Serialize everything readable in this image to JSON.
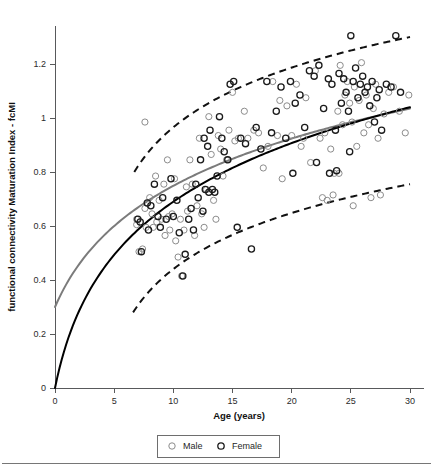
{
  "figure": {
    "background_color": "#ffffff",
    "footer_rule_color": "#767676"
  },
  "chart_data": {
    "type": "scatter",
    "title": "",
    "xlabel": "Age (years)",
    "ylabel": "functional connectivity Maturation Index - fcMI",
    "xlim": [
      0,
      30
    ],
    "ylim": [
      0,
      1.35
    ],
    "xticks": [
      0,
      5,
      10,
      15,
      20,
      25,
      30
    ],
    "xtick_labels": [
      "0",
      "5",
      "10",
      "15",
      "20",
      "25",
      "30"
    ],
    "yticks": [
      0,
      0.2,
      0.4,
      0.6,
      0.8,
      1,
      1.2
    ],
    "ytick_labels": [
      "0",
      "0.2",
      "0.4",
      "0.6",
      "0.8",
      "1",
      "1.2"
    ],
    "grid": false,
    "legend_position": "below-axes",
    "legend": [
      {
        "name": "Male",
        "marker": "open-circle",
        "color": "#8c8c8c"
      },
      {
        "name": "Female",
        "marker": "open-circle",
        "color": "#1b1b1b"
      }
    ],
    "series": [
      {
        "name": "Male",
        "marker": "open-circle",
        "color": "#8c8c8c",
        "points": [
          [
            7.6,
            0.985
          ],
          [
            6.9,
            0.625
          ],
          [
            6.9,
            0.605
          ],
          [
            7.1,
            0.505
          ],
          [
            7.4,
            0.515
          ],
          [
            7.6,
            0.665
          ],
          [
            7.7,
            0.595
          ],
          [
            8.0,
            0.705
          ],
          [
            8.2,
            0.645
          ],
          [
            8.3,
            0.595
          ],
          [
            8.5,
            0.785
          ],
          [
            8.6,
            0.615
          ],
          [
            8.8,
            0.695
          ],
          [
            9.0,
            0.625
          ],
          [
            9.2,
            0.755
          ],
          [
            9.3,
            0.565
          ],
          [
            9.5,
            0.845
          ],
          [
            9.6,
            0.635
          ],
          [
            9.7,
            0.585
          ],
          [
            9.9,
            0.645
          ],
          [
            10.1,
            0.775
          ],
          [
            10.2,
            0.545
          ],
          [
            10.4,
            0.485
          ],
          [
            10.6,
            0.625
          ],
          [
            10.7,
            0.415
          ],
          [
            10.9,
            0.585
          ],
          [
            11.1,
            0.745
          ],
          [
            11.2,
            0.655
          ],
          [
            11.4,
            0.845
          ],
          [
            11.6,
            0.755
          ],
          [
            11.8,
            0.565
          ],
          [
            12.0,
            0.675
          ],
          [
            12.2,
            0.925
          ],
          [
            12.4,
            0.645
          ],
          [
            12.6,
            0.595
          ],
          [
            12.8,
            0.735
          ],
          [
            13.0,
            1.005
          ],
          [
            13.2,
            0.865
          ],
          [
            13.4,
            0.695
          ],
          [
            13.6,
            0.625
          ],
          [
            13.8,
            0.935
          ],
          [
            14.0,
            0.885
          ],
          [
            14.2,
            0.785
          ],
          [
            14.5,
            0.845
          ],
          [
            14.7,
            0.955
          ],
          [
            15.0,
            1.095
          ],
          [
            15.2,
            0.915
          ],
          [
            15.5,
            0.925
          ],
          [
            16.0,
            1.025
          ],
          [
            16.3,
            0.925
          ],
          [
            16.8,
            0.955
          ],
          [
            17.2,
            0.945
          ],
          [
            17.6,
            0.815
          ],
          [
            18.0,
            0.895
          ],
          [
            18.4,
            1.135
          ],
          [
            18.8,
            0.935
          ],
          [
            19.2,
            0.775
          ],
          [
            19.6,
            1.045
          ],
          [
            20.0,
            0.935
          ],
          [
            20.4,
            1.125
          ],
          [
            20.8,
            0.895
          ],
          [
            21.2,
            1.075
          ],
          [
            21.6,
            0.835
          ],
          [
            22.0,
            1.175
          ],
          [
            22.4,
            0.925
          ],
          [
            22.8,
            0.945
          ],
          [
            23.0,
            0.695
          ],
          [
            23.3,
            0.885
          ],
          [
            23.6,
            0.795
          ],
          [
            23.9,
            1.025
          ],
          [
            24.1,
            1.195
          ],
          [
            24.3,
            0.975
          ],
          [
            24.5,
            1.085
          ],
          [
            24.7,
            1.135
          ],
          [
            24.9,
            1.055
          ],
          [
            25.1,
            0.985
          ],
          [
            25.3,
            1.115
          ],
          [
            25.5,
            0.895
          ],
          [
            25.7,
            1.065
          ],
          [
            25.9,
            1.205
          ],
          [
            26.1,
            0.945
          ],
          [
            26.3,
            1.085
          ],
          [
            26.5,
            0.975
          ],
          [
            26.7,
            0.705
          ],
          [
            26.9,
            1.035
          ],
          [
            27.1,
            1.125
          ],
          [
            27.3,
            0.925
          ],
          [
            27.5,
            0.715
          ],
          [
            27.8,
            1.015
          ],
          [
            28.2,
            1.095
          ],
          [
            28.6,
            1.115
          ],
          [
            29.1,
            1.025
          ],
          [
            29.6,
            0.945
          ],
          [
            29.9,
            1.085
          ],
          [
            23.5,
            0.715
          ],
          [
            22.6,
            0.705
          ],
          [
            25.2,
            0.675
          ],
          [
            24.0,
            0.795
          ],
          [
            21.0,
            0.925
          ],
          [
            19.0,
            1.065
          ]
        ]
      },
      {
        "name": "Female",
        "marker": "open-circle",
        "color": "#1b1b1b",
        "points": [
          [
            7.0,
            0.625
          ],
          [
            7.2,
            0.615
          ],
          [
            7.3,
            0.505
          ],
          [
            7.8,
            0.685
          ],
          [
            7.9,
            0.585
          ],
          [
            8.1,
            0.675
          ],
          [
            8.4,
            0.755
          ],
          [
            8.7,
            0.635
          ],
          [
            8.9,
            0.595
          ],
          [
            9.1,
            0.705
          ],
          [
            9.4,
            0.625
          ],
          [
            9.8,
            0.775
          ],
          [
            10.0,
            0.635
          ],
          [
            10.3,
            0.695
          ],
          [
            10.5,
            0.575
          ],
          [
            10.8,
            0.415
          ],
          [
            11.0,
            0.495
          ],
          [
            11.3,
            0.625
          ],
          [
            11.5,
            0.665
          ],
          [
            11.7,
            0.585
          ],
          [
            11.9,
            0.755
          ],
          [
            12.1,
            0.705
          ],
          [
            12.3,
            0.845
          ],
          [
            12.5,
            0.655
          ],
          [
            12.7,
            0.735
          ],
          [
            12.9,
            0.895
          ],
          [
            13.1,
            0.955
          ],
          [
            13.3,
            0.735
          ],
          [
            13.5,
            0.725
          ],
          [
            13.7,
            0.785
          ],
          [
            13.9,
            1.005
          ],
          [
            14.1,
            0.925
          ],
          [
            14.3,
            0.875
          ],
          [
            14.6,
            0.845
          ],
          [
            14.8,
            1.125
          ],
          [
            15.1,
            1.135
          ],
          [
            15.4,
            0.595
          ],
          [
            15.7,
            0.925
          ],
          [
            16.1,
            0.905
          ],
          [
            16.6,
            0.515
          ],
          [
            17.0,
            0.965
          ],
          [
            17.4,
            0.885
          ],
          [
            17.9,
            1.135
          ],
          [
            18.3,
            0.945
          ],
          [
            18.7,
            1.025
          ],
          [
            19.1,
            1.115
          ],
          [
            19.5,
            0.925
          ],
          [
            19.9,
            1.135
          ],
          [
            20.3,
            1.055
          ],
          [
            20.7,
            1.085
          ],
          [
            21.1,
            0.965
          ],
          [
            21.5,
            1.175
          ],
          [
            21.9,
            1.155
          ],
          [
            22.3,
            1.195
          ],
          [
            22.7,
            1.035
          ],
          [
            23.1,
            1.145
          ],
          [
            23.4,
            1.125
          ],
          [
            23.7,
            0.955
          ],
          [
            24.0,
            1.165
          ],
          [
            24.2,
            1.055
          ],
          [
            24.4,
            1.145
          ],
          [
            24.6,
            1.095
          ],
          [
            24.8,
            1.025
          ],
          [
            25.0,
            1.305
          ],
          [
            25.2,
            1.135
          ],
          [
            25.4,
            1.185
          ],
          [
            25.6,
            1.075
          ],
          [
            25.8,
            1.125
          ],
          [
            26.0,
            1.155
          ],
          [
            26.2,
            1.095
          ],
          [
            26.4,
            1.115
          ],
          [
            26.6,
            1.045
          ],
          [
            26.8,
            1.135
          ],
          [
            27.0,
            0.985
          ],
          [
            27.2,
            1.075
          ],
          [
            27.4,
            1.105
          ],
          [
            27.6,
            0.955
          ],
          [
            28.0,
            1.125
          ],
          [
            28.4,
            1.115
          ],
          [
            28.8,
            1.305
          ],
          [
            29.2,
            1.095
          ],
          [
            24.9,
            0.875
          ],
          [
            23.8,
            0.805
          ],
          [
            23.2,
            0.795
          ],
          [
            22.1,
            0.835
          ],
          [
            20.1,
            0.795
          ],
          [
            13.0,
            0.725
          ],
          [
            12.6,
            0.925
          ]
        ]
      }
    ],
    "fit_curves": [
      {
        "name": "black-fit",
        "style": "solid",
        "color": "#000000",
        "start": [
          0,
          0
        ],
        "end": [
          30,
          1.04
        ],
        "description": "logarithmic maturation fit through origin"
      },
      {
        "name": "gray-fit",
        "style": "solid",
        "color": "#7b7b7b",
        "start": [
          0,
          0.3
        ],
        "end": [
          30,
          1.035
        ],
        "description": "alternate model fit with positive intercept"
      },
      {
        "name": "upper-confidence-band",
        "style": "dashed",
        "color": "#111111",
        "start": [
          6.7,
          0.8
        ],
        "end": [
          30,
          1.3
        ]
      },
      {
        "name": "lower-confidence-band",
        "style": "dashed",
        "color": "#111111",
        "start": [
          6.6,
          0.28
        ],
        "end": [
          30,
          0.755
        ]
      }
    ]
  }
}
